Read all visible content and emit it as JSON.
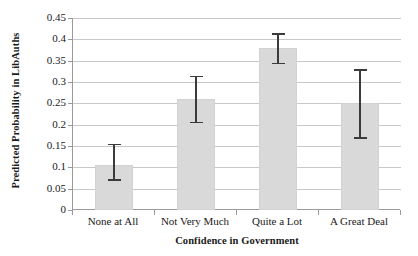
{
  "chart_data": {
    "type": "bar",
    "title": "",
    "xlabel": "Confidence in Government",
    "ylabel": "Predicted Probability in LibAuths",
    "categories": [
      "None at All",
      "Not Very Much",
      "Quite a Lot",
      "A Great Deal"
    ],
    "values": [
      0.105,
      0.26,
      0.38,
      0.25
    ],
    "error_low": [
      0.072,
      0.207,
      0.345,
      0.17
    ],
    "error_high": [
      0.155,
      0.315,
      0.415,
      0.33
    ],
    "ylim": [
      0,
      0.45
    ],
    "ytick_values": [
      0,
      0.05,
      0.1,
      0.15,
      0.2,
      0.25,
      0.3,
      0.35,
      0.4,
      0.45
    ],
    "ytick_labels": [
      "0",
      "0.05",
      "0.1",
      "0.15",
      "0.2",
      "0.25",
      "0.3",
      "0.35",
      "0.4",
      "0.45"
    ],
    "grid": true,
    "legend": false,
    "legend_position": "none",
    "bar_color": "#d9d9d9",
    "errorbar_color": "#3b3b3b",
    "gridline_color": "#c8c8c8",
    "axis_color": "#9a9a9a",
    "background_color": "#ffffff"
  }
}
